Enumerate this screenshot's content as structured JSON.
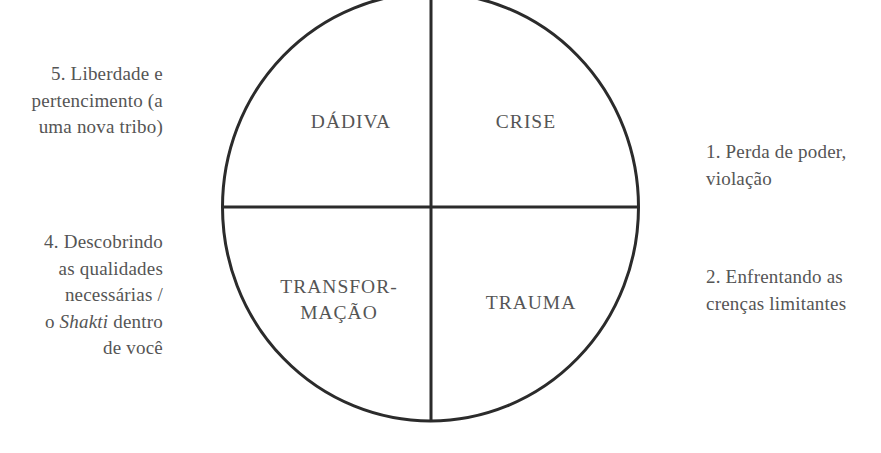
{
  "diagram": {
    "type": "quadrant-cycle",
    "colors": {
      "line": "#2b2b2b",
      "text": "#555555",
      "background": "#ffffff"
    },
    "quadrants": {
      "top_left": {
        "label": "DÁDIVA"
      },
      "top_right": {
        "label": "CRISE"
      },
      "bottom_left": {
        "lines": [
          "TRANSFOR-",
          "MAÇÃO"
        ]
      },
      "bottom_right": {
        "label": "TRAUMA"
      }
    },
    "stages": {
      "stage1": {
        "lines": [
          "1. Perda de poder,",
          "violação"
        ]
      },
      "stage2": {
        "lines": [
          "2. Enfrentando as",
          "crenças limitantes"
        ]
      },
      "stage4": {
        "lines": [
          "4. Descobrindo",
          "as qualidades",
          "necessárias /"
        ],
        "line4_prefix": "o ",
        "line4_italic": "Shakti",
        "line4_suffix": " dentro",
        "line5": "de você"
      },
      "stage5": {
        "lines": [
          "5. Liberdade e",
          "pertencimento (a",
          "uma nova tribo)"
        ]
      }
    }
  }
}
